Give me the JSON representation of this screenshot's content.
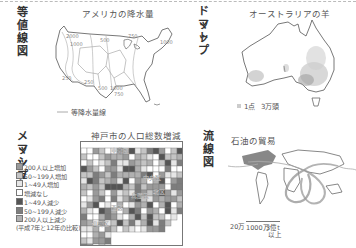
{
  "panels": {
    "isoline": {
      "heading": "等値線図",
      "subtitle": "アメリカの降水量",
      "legend_label": "等降水量線",
      "contour_labels": [
        "2000",
        "1000",
        "500",
        "250",
        "750",
        "250",
        "500",
        "1000",
        "750",
        "750"
      ]
    },
    "dot": {
      "heading_line1": "ドット",
      "heading_line2": "マップ",
      "subtitle": "オーストラリアの羊",
      "legend_dot": "1点",
      "legend_value": "3万頭"
    },
    "mesh": {
      "heading_line1": "メッシュ",
      "heading_line2": "マップ",
      "subtitle": "神戸市の人口総数増減",
      "legend": [
        {
          "label": "200人以上増加",
          "color": "#9a9a9a"
        },
        {
          "label": "50~199人増加",
          "color": "#c4c4c4"
        },
        {
          "label": "1~49人増加",
          "color": "#e6e6e6"
        },
        {
          "label": "増減なし",
          "color": "#ffffff"
        },
        {
          "label": "1~49人減少",
          "color": "#555555"
        },
        {
          "label": "50~199人減少",
          "color": "#7d7d7d"
        },
        {
          "label": "200人以上減少",
          "color": "#b0b0b0"
        }
      ],
      "note": "(平成7年と12年の比較)",
      "district_labels": [
        "東灘区",
        "中央区",
        "兵庫区",
        "西区",
        "須磨区",
        "北区"
      ]
    },
    "flow": {
      "heading": "流線図",
      "subtitle": "石油の貿易",
      "legend": [
        "20万",
        "1000万",
        "3億t",
        "以上"
      ]
    }
  }
}
